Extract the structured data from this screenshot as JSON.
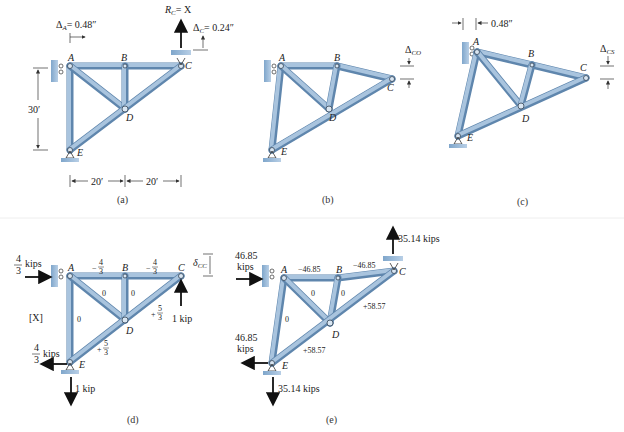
{
  "figure": {
    "panels": [
      {
        "id": "a",
        "caption": "(a)",
        "nodes": [
          "A",
          "B",
          "C",
          "D",
          "E"
        ],
        "annotations": {
          "delta_A": "ΔA = 0.48″",
          "reaction_C": "RC = X",
          "delta_C": "ΔC = 0.24″",
          "height": "30′",
          "span_1": "20′",
          "span_2": "20′"
        }
      },
      {
        "id": "b",
        "caption": "(b)",
        "nodes": [
          "A",
          "B",
          "C",
          "D",
          "E"
        ],
        "annotations": {
          "delta_CO": "ΔCO"
        }
      },
      {
        "id": "c",
        "caption": "(c)",
        "nodes": [
          "A",
          "B",
          "C",
          "D",
          "E"
        ],
        "annotations": {
          "shift_A": "0.48″",
          "delta_CS": "ΔCS"
        }
      },
      {
        "id": "d",
        "caption": "(d)",
        "nodes": [
          "A",
          "B",
          "C",
          "D",
          "E"
        ],
        "label": "[X]",
        "loads": {
          "A_horizontal": "4/3 kips",
          "C_vertical": "1 kip",
          "E_horizontal": "4/3 kips",
          "E_vertical": "1 kip"
        },
        "member_forces": {
          "AB": "−4/3",
          "BC": "−4/3",
          "AD": "0",
          "BD": "0",
          "AE": "0",
          "CD": "+5/3",
          "DE": "+5/3"
        },
        "delta": "δCC"
      },
      {
        "id": "e",
        "caption": "(e)",
        "nodes": [
          "A",
          "B",
          "C",
          "D",
          "E"
        ],
        "loads": {
          "A_horizontal": "46.85 kips",
          "C_vertical": "35.14 kips",
          "E_horizontal": "46.85 kips",
          "E_vertical": "35.14 kips"
        },
        "member_forces": {
          "AB": "−46.85",
          "BC": "−46.85",
          "AD": "0",
          "BD": "0",
          "AE": "0",
          "CD": "+58.57",
          "DE": "+58.57"
        }
      }
    ]
  },
  "text": {
    "A": "A",
    "B": "B",
    "C": "C",
    "D": "D",
    "E": "E",
    "a_dA": "Δ",
    "a_dA_sub": "A",
    "a_dA_val": "= 0.48″",
    "a_RC": "R",
    "a_RC_sub": "C",
    "a_RC_val": "= X",
    "a_dC": "Δ",
    "a_dC_sub": "C",
    "a_dC_val": "= 0.24″",
    "a_h": "30′",
    "a_s1": "20′",
    "a_s2": "20′",
    "b_d": "Δ",
    "b_d_sub": "CO",
    "c_shift": "0.48″",
    "c_d": "Δ",
    "c_d_sub": "CS",
    "d_X": "[X]",
    "d_kips": "kips",
    "d_4": "4",
    "d_3": "3",
    "d_1kip": "1 kip",
    "d_m43": "−",
    "d_p": "+",
    "d_5": "5",
    "d_zero": "0",
    "d_delta": "δ",
    "d_delta_sub": "CC",
    "e_4685": "46.85",
    "e_kips": "kips",
    "e_3514": "35.14 kips",
    "e_m4685": "−46.85",
    "e_p5857": "+58.57",
    "e_zero": "0",
    "cap_a": "(a)",
    "cap_b": "(b)",
    "cap_c": "(c)",
    "cap_d": "(d)",
    "cap_e": "(e)"
  }
}
